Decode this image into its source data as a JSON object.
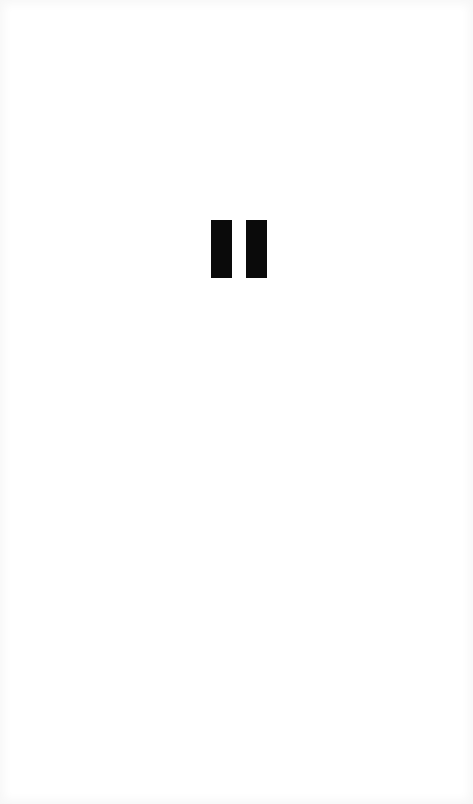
{
  "screen": {
    "background_color": "#ffffff",
    "content": "blank"
  },
  "player": {
    "state": "paused",
    "control": {
      "icon": "pause-icon",
      "label": "Pause",
      "color": "#0a0a0a"
    }
  }
}
